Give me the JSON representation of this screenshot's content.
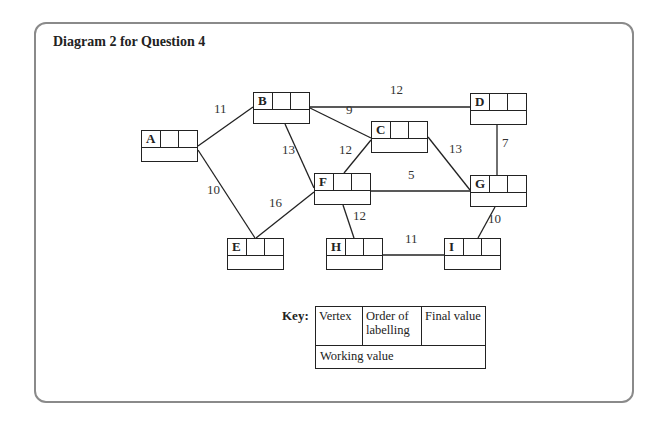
{
  "title": "Diagram 2 for Question 4",
  "nodes": [
    {
      "id": "A",
      "x": 141,
      "y": 130
    },
    {
      "id": "B",
      "x": 253,
      "y": 92
    },
    {
      "id": "C",
      "x": 371,
      "y": 121
    },
    {
      "id": "D",
      "x": 470,
      "y": 93
    },
    {
      "id": "E",
      "x": 227,
      "y": 238
    },
    {
      "id": "F",
      "x": 314,
      "y": 173
    },
    {
      "id": "G",
      "x": 470,
      "y": 175
    },
    {
      "id": "H",
      "x": 326,
      "y": 238
    },
    {
      "id": "I",
      "x": 444,
      "y": 238
    }
  ],
  "edges": [
    {
      "from": "A",
      "to": "B",
      "weight": "11",
      "lx": 214,
      "ly": 109
    },
    {
      "from": "A",
      "to": "E",
      "weight": "10",
      "lx": 207,
      "ly": 190
    },
    {
      "from": "B",
      "to": "D",
      "weight": "12",
      "lx": 390,
      "ly": 90
    },
    {
      "from": "B",
      "to": "C",
      "weight": "9",
      "lx": 346,
      "ly": 110
    },
    {
      "from": "B",
      "to": "F",
      "weight": "13",
      "lx": 282,
      "ly": 150
    },
    {
      "from": "C",
      "to": "F",
      "weight": "12",
      "lx": 339,
      "ly": 150
    },
    {
      "from": "C",
      "to": "G",
      "weight": "13",
      "lx": 449,
      "ly": 149
    },
    {
      "from": "D",
      "to": "G",
      "weight": "7",
      "lx": 502,
      "ly": 143
    },
    {
      "from": "F",
      "to": "G",
      "weight": "5",
      "lx": 408,
      "ly": 175
    },
    {
      "from": "E",
      "to": "F",
      "weight": "16",
      "lx": 269,
      "ly": 203
    },
    {
      "from": "F",
      "to": "H",
      "weight": "12",
      "lx": 353,
      "ly": 216
    },
    {
      "from": "H",
      "to": "I",
      "weight": "11",
      "lx": 405,
      "ly": 239
    },
    {
      "from": "G",
      "to": "I",
      "weight": "10",
      "lx": 488,
      "ly": 219
    }
  ],
  "key": {
    "label": "Key:",
    "vertex": "Vertex",
    "order": "Order of labelling",
    "final": "Final value",
    "working": "Working value"
  }
}
